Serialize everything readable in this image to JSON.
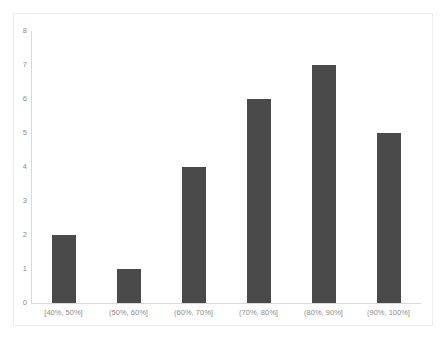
{
  "chart_data": {
    "type": "bar",
    "title": "",
    "subtitle": "",
    "xlabel": "",
    "ylabel": "",
    "categories": [
      "[40%, 50%]",
      "(50%, 60%]",
      "(60%, 70%]",
      "(70%, 80%]",
      "(80%, 90%]",
      "(90%, 100%]"
    ],
    "values": [
      2,
      1,
      4,
      6,
      7,
      5
    ],
    "ylim": [
      0,
      8
    ],
    "y_ticks": [
      "0",
      "1",
      "2",
      "3",
      "4",
      "5",
      "6",
      "7",
      "8"
    ],
    "y_tick_values": [
      0,
      1,
      2,
      3,
      4,
      5,
      6,
      7,
      8
    ],
    "grid": false,
    "legend": "none",
    "bar_color": "#4a4a4a",
    "axis_color": "#d9d9d9",
    "tick_label_color": "#8d8d8d",
    "plot_background": "#ffffff",
    "frame_color": "#eceded"
  }
}
